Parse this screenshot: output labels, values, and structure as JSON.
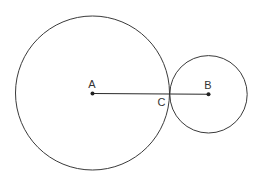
{
  "diagram": {
    "type": "geometry",
    "stroke_color": "#3a3a3a",
    "background": "#ffffff",
    "circles": [
      {
        "name": "circle-A",
        "center": "A",
        "cx": 92.5,
        "cy": 93,
        "r": 77
      },
      {
        "name": "circle-B",
        "center": "B",
        "cx": 208.5,
        "cy": 94.3,
        "r": 38.7
      }
    ],
    "points": [
      {
        "label": "A",
        "x": 92.5,
        "y": 93.5,
        "label_x": 92,
        "label_y": 88
      },
      {
        "label": "B",
        "x": 208.5,
        "y": 94.3,
        "label_x": 208,
        "label_y": 89
      },
      {
        "label": "C",
        "x": 169.5,
        "y": 94,
        "label_x": 161.5,
        "label_y": 106
      }
    ],
    "segments": [
      {
        "from": "A",
        "to": "B"
      }
    ],
    "labels": {
      "A": "A",
      "B": "B",
      "C": "C"
    }
  }
}
